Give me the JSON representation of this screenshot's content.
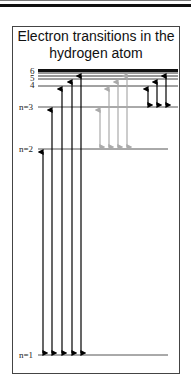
{
  "title_line1": "Electron transitions in the",
  "title_line2": "hydrogen atom",
  "levels": [
    {
      "n": 1,
      "label": "n=1",
      "y": 355
    },
    {
      "n": 2,
      "label": "n=2",
      "y": 149
    },
    {
      "n": 3,
      "label": "n=3",
      "y": 107
    },
    {
      "n": 4,
      "label": "4",
      "y": 86
    },
    {
      "n": 5,
      "label": "5",
      "y": 79
    },
    {
      "n": 6,
      "label": "6",
      "y": 73
    }
  ],
  "series": [
    {
      "name": "Lyman (to/from n=1)",
      "color": "#000000",
      "transitions": [
        "2-1",
        "3-1",
        "4-1",
        "5-1",
        "6-1"
      ]
    },
    {
      "name": "Balmer (to/from n=2)",
      "color": "#aaaaaa",
      "transitions": [
        "3-2",
        "4-2",
        "5-2",
        "6-2"
      ]
    },
    {
      "name": "Paschen (to/from n=3)",
      "color": "#000000",
      "transitions": [
        "4-3",
        "5-3",
        "6-3"
      ]
    }
  ],
  "colors": {
    "frame": "#444444",
    "black_arrow": "#000000",
    "gray_arrow": "#aaaaaa",
    "level_line": "#555555"
  }
}
